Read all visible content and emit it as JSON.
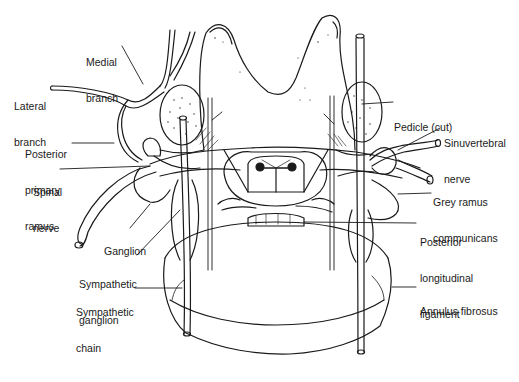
{
  "diagram": {
    "colors": {
      "stroke": "#1a1a1a",
      "background": "#ffffff",
      "text": "#1a1a1a"
    },
    "labels": {
      "medial_branch": [
        "Medial",
        "branch"
      ],
      "lateral_branch": [
        "Lateral",
        "branch"
      ],
      "posterior_primary_ramus": [
        "Posterior",
        "primary",
        "ramus"
      ],
      "spinal_nerve": [
        "Spinal",
        "nerve"
      ],
      "ganglion": [
        "Ganglion"
      ],
      "sympathetic_ganglion": [
        "Sympathetic",
        "ganglion"
      ],
      "sympathetic_chain": [
        "Sympathetic",
        "chain"
      ],
      "pedicle_cut": [
        "Pedicle (cut)"
      ],
      "sinuvertebral_nerve": [
        "Sinuvertebral",
        "nerve"
      ],
      "grey_ramus_communicans": [
        "Grey ramus",
        "communicans"
      ],
      "posterior_longitudinal_ligament": [
        "Posterior",
        "longitudinal",
        "ligament"
      ],
      "annulus_fibrosus": [
        "Annulus fibrosus"
      ]
    }
  }
}
